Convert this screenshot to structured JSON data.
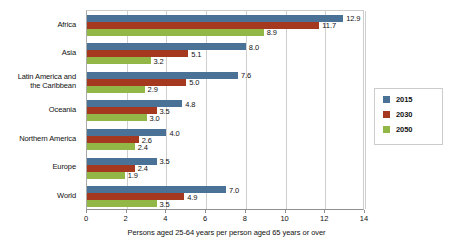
{
  "chart_data": {
    "type": "bar",
    "orientation": "horizontal",
    "title": "",
    "subtitle": "",
    "xlabel": "Persons aged 25-64 years per person aged 65 years or over",
    "ylabel": "",
    "xlim": [
      0,
      14
    ],
    "xticks": [
      0,
      2,
      4,
      6,
      8,
      10,
      12,
      14
    ],
    "xtick_labels": [
      "0",
      "2",
      "4",
      "6",
      "8",
      "10",
      "12",
      "14"
    ],
    "grid": "vertical",
    "legend_position": "right",
    "categories": [
      "Africa",
      "Asia",
      "Latin America and\nthe Caribbean",
      "Oceania",
      "Northern America",
      "Europe",
      "World"
    ],
    "series": [
      {
        "name": "2015",
        "color": "#4a7296",
        "values": [
          12.9,
          8.0,
          7.6,
          4.8,
          4.0,
          3.5,
          7.0
        ],
        "labels": [
          "12.9",
          "8.0",
          "7.6",
          "4.8",
          "4.0",
          "3.5",
          "7.0"
        ]
      },
      {
        "name": "2030",
        "color": "#a4391f",
        "values": [
          11.7,
          5.1,
          5.0,
          3.5,
          2.6,
          2.4,
          4.9
        ],
        "labels": [
          "11.7",
          "5.1",
          "5.0",
          "3.5",
          "2.6",
          "2.4",
          "4.9"
        ]
      },
      {
        "name": "2050",
        "color": "#93b746",
        "values": [
          8.9,
          3.2,
          2.9,
          3.0,
          2.4,
          1.9,
          3.5
        ],
        "labels": [
          "8.9",
          "3.2",
          "2.9",
          "3.0",
          "2.4",
          "1.9",
          "3.5"
        ]
      }
    ]
  },
  "legend": {
    "items": [
      {
        "label": "2015",
        "color": "#4a7296"
      },
      {
        "label": "2030",
        "color": "#a4391f"
      },
      {
        "label": "2050",
        "color": "#93b746"
      }
    ]
  }
}
